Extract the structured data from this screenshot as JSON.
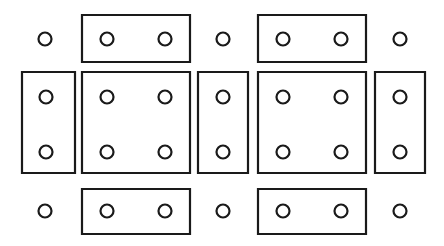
{
  "diagram": {
    "type": "technical-line-drawing",
    "canvas": {
      "width": 444,
      "height": 246,
      "background_color": "#ffffff"
    },
    "style": {
      "stroke_color": "#1a1a1a",
      "fill_color": "#ffffff",
      "stroke_width": 2.2,
      "hole_radius": 6.5
    },
    "grid": {
      "columns": 7,
      "rows": 3,
      "column_kinds": [
        "gap",
        "panel",
        "gap",
        "panel",
        "gap"
      ],
      "row_labels": [
        "top",
        "middle",
        "bottom"
      ],
      "column_centers": [
        45,
        136,
        223,
        312,
        400
      ],
      "row_centers": [
        39,
        97,
        152,
        211
      ]
    },
    "rectangles": [
      {
        "id": "rect-top-left",
        "label": "Top left wide panel",
        "x": 82,
        "y": 15,
        "width": 108,
        "height": 47,
        "shape": "wide",
        "hole_count": 2
      },
      {
        "id": "rect-top-right",
        "label": "Top right wide panel",
        "x": 258,
        "y": 15,
        "width": 108,
        "height": 47,
        "shape": "wide",
        "hole_count": 2
      },
      {
        "id": "rect-mid-far-left",
        "label": "Middle far left tall panel",
        "x": 22,
        "y": 72,
        "width": 53,
        "height": 101,
        "shape": "tall",
        "hole_count": 2
      },
      {
        "id": "rect-mid-left",
        "label": "Middle left square panel",
        "x": 82,
        "y": 72,
        "width": 108,
        "height": 101,
        "shape": "square",
        "hole_count": 4
      },
      {
        "id": "rect-mid-center",
        "label": "Middle center tall panel",
        "x": 198,
        "y": 72,
        "width": 50,
        "height": 101,
        "shape": "tall",
        "hole_count": 2
      },
      {
        "id": "rect-mid-right",
        "label": "Middle right square panel",
        "x": 258,
        "y": 72,
        "width": 108,
        "height": 101,
        "shape": "square",
        "hole_count": 4
      },
      {
        "id": "rect-mid-far-right",
        "label": "Middle far right tall panel",
        "x": 375,
        "y": 72,
        "width": 50,
        "height": 101,
        "shape": "tall",
        "hole_count": 2
      },
      {
        "id": "rect-bot-left",
        "label": "Bottom left wide panel",
        "x": 82,
        "y": 189,
        "width": 108,
        "height": 45,
        "shape": "wide",
        "hole_count": 2
      },
      {
        "id": "rect-bot-right",
        "label": "Bottom right wide panel",
        "x": 258,
        "y": 189,
        "width": 108,
        "height": 45,
        "shape": "wide",
        "hole_count": 2
      }
    ],
    "holes": [
      {
        "id": "hole-r1-c2a",
        "cx": 107,
        "cy": 39,
        "parent": "rect-top-left"
      },
      {
        "id": "hole-r1-c2b",
        "cx": 165,
        "cy": 39,
        "parent": "rect-top-left"
      },
      {
        "id": "hole-r1-c4a",
        "cx": 283,
        "cy": 39,
        "parent": "rect-top-right"
      },
      {
        "id": "hole-r1-c4b",
        "cx": 341,
        "cy": 39,
        "parent": "rect-top-right"
      },
      {
        "id": "hole-r2-c1a",
        "cx": 46,
        "cy": 97,
        "parent": "rect-mid-far-left"
      },
      {
        "id": "hole-r2-c1b",
        "cx": 46,
        "cy": 152,
        "parent": "rect-mid-far-left"
      },
      {
        "id": "hole-r2-c2a",
        "cx": 107,
        "cy": 97,
        "parent": "rect-mid-left"
      },
      {
        "id": "hole-r2-c2b",
        "cx": 165,
        "cy": 97,
        "parent": "rect-mid-left"
      },
      {
        "id": "hole-r2-c2c",
        "cx": 107,
        "cy": 152,
        "parent": "rect-mid-left"
      },
      {
        "id": "hole-r2-c2d",
        "cx": 165,
        "cy": 152,
        "parent": "rect-mid-left"
      },
      {
        "id": "hole-r2-c3a",
        "cx": 223,
        "cy": 97,
        "parent": "rect-mid-center"
      },
      {
        "id": "hole-r2-c3b",
        "cx": 223,
        "cy": 152,
        "parent": "rect-mid-center"
      },
      {
        "id": "hole-r2-c4a",
        "cx": 283,
        "cy": 97,
        "parent": "rect-mid-right"
      },
      {
        "id": "hole-r2-c4b",
        "cx": 341,
        "cy": 97,
        "parent": "rect-mid-right"
      },
      {
        "id": "hole-r2-c4c",
        "cx": 283,
        "cy": 152,
        "parent": "rect-mid-right"
      },
      {
        "id": "hole-r2-c4d",
        "cx": 341,
        "cy": 152,
        "parent": "rect-mid-right"
      },
      {
        "id": "hole-r2-c5a",
        "cx": 400,
        "cy": 97,
        "parent": "rect-mid-far-right"
      },
      {
        "id": "hole-r2-c5b",
        "cx": 400,
        "cy": 152,
        "parent": "rect-mid-far-right"
      },
      {
        "id": "hole-r3-c2a",
        "cx": 107,
        "cy": 211,
        "parent": "rect-bot-left"
      },
      {
        "id": "hole-r3-c2b",
        "cx": 165,
        "cy": 211,
        "parent": "rect-bot-left"
      },
      {
        "id": "hole-r3-c4a",
        "cx": 283,
        "cy": 211,
        "parent": "rect-bot-right"
      },
      {
        "id": "hole-r3-c4b",
        "cx": 341,
        "cy": 211,
        "parent": "rect-bot-right"
      }
    ],
    "free_circles": [
      {
        "id": "free-r1-c1",
        "cx": 45,
        "cy": 39,
        "label": "Top row left free hole"
      },
      {
        "id": "free-r1-c3",
        "cx": 223,
        "cy": 39,
        "label": "Top row center free hole"
      },
      {
        "id": "free-r1-c5",
        "cx": 400,
        "cy": 39,
        "label": "Top row right free hole"
      },
      {
        "id": "free-r3-c1",
        "cx": 45,
        "cy": 211,
        "label": "Bottom row left free hole"
      },
      {
        "id": "free-r3-c3",
        "cx": 223,
        "cy": 211,
        "label": "Bottom row center free hole"
      },
      {
        "id": "free-r3-c5",
        "cx": 400,
        "cy": 211,
        "label": "Bottom row right free hole"
      }
    ]
  }
}
